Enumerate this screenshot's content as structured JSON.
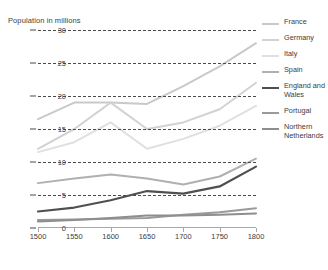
{
  "chart": {
    "axis_title": "Population in millions",
    "y_ticks": [
      "30",
      "25",
      "20",
      "15",
      "10",
      "5",
      "0"
    ],
    "x_ticks": [
      "1500",
      "1550",
      "1600",
      "1650",
      "1700",
      "1750",
      "1800"
    ]
  },
  "legend": {
    "items": [
      {
        "label": "France",
        "color": "#c9c9c9",
        "width": 2.0
      },
      {
        "label": "Germany",
        "color": "#d2d2d2",
        "width": 2.0
      },
      {
        "label": "Italy",
        "color": "#e0e0e0",
        "width": 2.0
      },
      {
        "label": "Spain",
        "color": "#b0b0b0",
        "width": 2.0
      },
      {
        "label": "England and Wales",
        "color": "#4f4f4f",
        "width": 2.2
      },
      {
        "label": "Portugal",
        "color": "#9a9a9a",
        "width": 2.0
      },
      {
        "label": "Northern Netherlands",
        "color": "#8e8e8e",
        "width": 2.0
      }
    ]
  },
  "chart_data": {
    "type": "line",
    "title": "",
    "xlabel": "",
    "ylabel": "Population in millions",
    "xlim": [
      1500,
      1800
    ],
    "ylim": [
      0,
      30
    ],
    "grid": true,
    "legend_position": "right",
    "x": [
      1500,
      1550,
      1600,
      1650,
      1700,
      1750,
      1800
    ],
    "series": [
      {
        "name": "France",
        "color": "#c9c9c9",
        "values": [
          16.5,
          19.0,
          19.0,
          18.8,
          21.5,
          24.5,
          28.0
        ]
      },
      {
        "name": "Germany",
        "color": "#d2d2d2",
        "values": [
          12.0,
          15.0,
          19.0,
          15.0,
          16.0,
          18.0,
          22.0
        ]
      },
      {
        "name": "Italy",
        "color": "#e0e0e0",
        "values": [
          11.5,
          13.0,
          16.0,
          12.0,
          13.5,
          15.5,
          18.5
        ]
      },
      {
        "name": "Spain",
        "color": "#b0b0b0",
        "values": [
          6.8,
          7.5,
          8.1,
          7.5,
          6.6,
          7.8,
          10.5
        ]
      },
      {
        "name": "England and Wales",
        "color": "#4f4f4f",
        "values": [
          2.5,
          3.1,
          4.2,
          5.6,
          5.2,
          6.3,
          9.3
        ]
      },
      {
        "name": "Portugal",
        "color": "#9a9a9a",
        "values": [
          1.2,
          1.3,
          1.4,
          1.5,
          2.0,
          2.4,
          3.0
        ]
      },
      {
        "name": "Northern Netherlands",
        "color": "#8e8e8e",
        "values": [
          1.0,
          1.2,
          1.5,
          1.9,
          1.9,
          2.0,
          2.2
        ]
      }
    ]
  }
}
